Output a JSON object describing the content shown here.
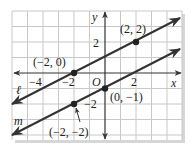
{
  "axes": {
    "x_label": "x",
    "y_label": "y",
    "origin_label": "O",
    "x_ticks": [
      {
        "value": -4,
        "label": "−4"
      },
      {
        "value": -2,
        "label": "−2"
      },
      {
        "value": 2,
        "label": "2"
      }
    ],
    "y_ticks": [
      {
        "value": 2,
        "label": "2"
      },
      {
        "value": -2,
        "label": "−2"
      }
    ],
    "x_range": [
      -6,
      5
    ],
    "y_range": [
      -4,
      4
    ],
    "grid": true
  },
  "lines": [
    {
      "name": "ℓ",
      "equation": "y = x/2 + 1",
      "slope": 0.5,
      "intercept": 1,
      "color": "#333333"
    },
    {
      "name": "m",
      "equation": "y = x/2 − 1",
      "slope": 0.5,
      "intercept": -1,
      "color": "#333333"
    }
  ],
  "points": [
    {
      "x": 2,
      "y": 2,
      "label": "(2, 2)",
      "line": "ℓ"
    },
    {
      "x": -2,
      "y": 0,
      "label": "(−2, 0)",
      "line": "ℓ"
    },
    {
      "x": 0,
      "y": -1,
      "label": "(0, −1)",
      "line": "m"
    },
    {
      "x": -2,
      "y": -2,
      "label": "(−2, −2)",
      "line": "m"
    }
  ],
  "colors": {
    "grid": "#c8c8c8",
    "axis": "#333333",
    "line": "#333333",
    "shadow": "#d6d6d6"
  }
}
